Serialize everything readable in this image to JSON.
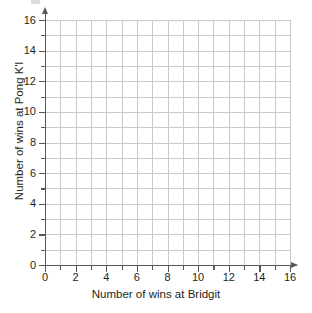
{
  "chart_data": {
    "type": "scatter",
    "title": "",
    "subtitle": "",
    "xlabel": "Number of wins at Bridgit",
    "ylabel": "Number of wins at Pong K'l",
    "xlim": [
      0,
      16
    ],
    "ylim": [
      0,
      16
    ],
    "xticks": [
      0,
      2,
      4,
      6,
      8,
      10,
      12,
      14,
      16
    ],
    "yticks": [
      0,
      2,
      4,
      6,
      8,
      10,
      12,
      14,
      16
    ],
    "xtick_labels": [
      "0",
      "2",
      "4",
      "6",
      "8",
      "10",
      "12",
      "14",
      "16"
    ],
    "ytick_labels": [
      "0",
      "2",
      "4",
      "6",
      "8",
      "10",
      "12",
      "14",
      "16"
    ],
    "minor_tick_step": 1,
    "grid": true,
    "grid_step": 1,
    "legend": null,
    "series": [],
    "values": [],
    "x": [],
    "annotations": [],
    "note": "Empty coordinate grid with no plotted data points"
  },
  "colors": {
    "background": "#ffffff",
    "gridline": "#c9c9cd",
    "axis": "#58585b",
    "text": "#231f20"
  }
}
